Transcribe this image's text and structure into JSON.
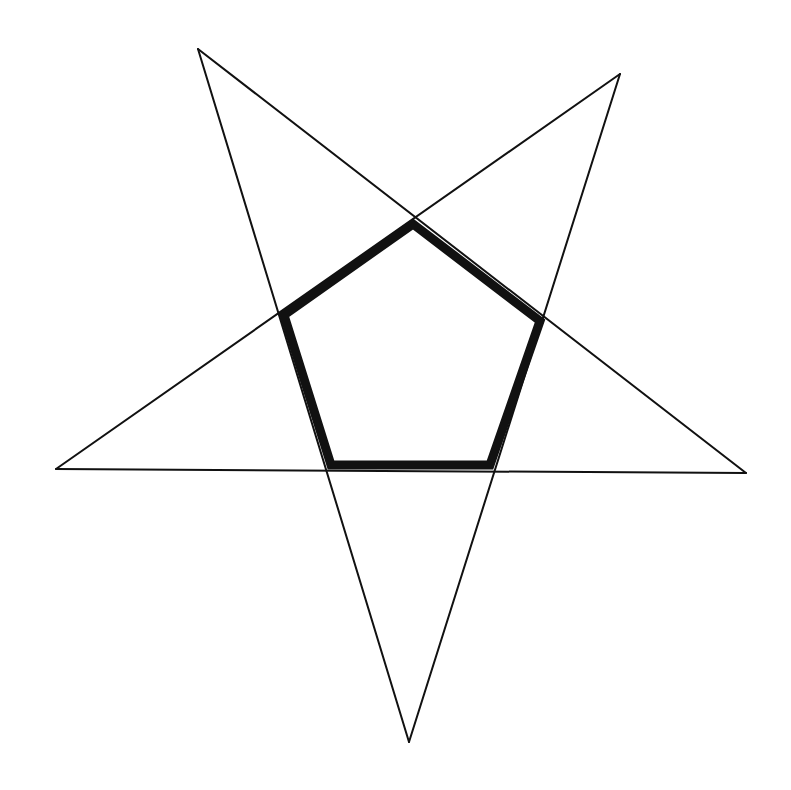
{
  "diagram": {
    "type": "pentagram",
    "colors": {
      "background": "#ffffff",
      "stroke": "#111111"
    },
    "star_points": {
      "top_left": [
        198,
        49
      ],
      "top_right": [
        620,
        74
      ],
      "left": [
        56,
        469
      ],
      "right": [
        746,
        473
      ],
      "bottom": [
        409,
        742
      ]
    },
    "star_lines": [
      {
        "from": "top_left",
        "to": "right"
      },
      {
        "from": "top_right",
        "to": "left"
      },
      {
        "from": "left",
        "to": "right"
      },
      {
        "from": "top_left",
        "to": "bottom"
      },
      {
        "from": "top_right",
        "to": "bottom"
      }
    ],
    "star_stroke_width": 2,
    "pentagon": {
      "vertices": [
        [
          413,
          224
        ],
        [
          540,
          321
        ],
        [
          490,
          465
        ],
        [
          331,
          465
        ],
        [
          284,
          315
        ]
      ],
      "stroke_width": 9
    }
  }
}
